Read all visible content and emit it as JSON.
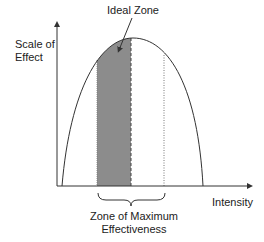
{
  "diagram": {
    "title_annotation": "Ideal Zone",
    "y_axis_label_line1": "Scale of",
    "y_axis_label_line2": "Effect",
    "x_axis_label": "Intensity",
    "zone_label_line1": "Zone of Maximum",
    "zone_label_line2": "Effectiveness",
    "colors": {
      "line": "#333333",
      "shade": "#8c8c8c",
      "background": "#ffffff"
    }
  }
}
